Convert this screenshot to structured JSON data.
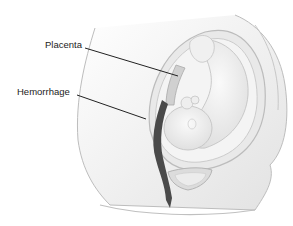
{
  "figure": {
    "labels": [
      {
        "text": "Placenta",
        "x": 45,
        "y": 44
      },
      {
        "text": "Hemorrhage",
        "x": 17,
        "y": 91
      }
    ]
  },
  "colors": {
    "line": "#222222",
    "body_outline": "#b8b8b8",
    "uterus_wall": "#cfcfcf",
    "fetus_fill": "#f1f1f1",
    "fetus_shade": "#d9d9d9",
    "hemorrhage": "#4a4a4a"
  }
}
